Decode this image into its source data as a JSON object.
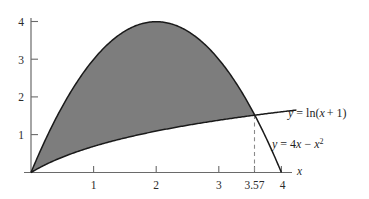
{
  "figure": {
    "title": "",
    "background_color": "#ffffff",
    "axis_color": "#555555",
    "curve_color": "#1a1a1a",
    "shade_color": "#7d7d7d",
    "dash_color": "#8a8a8a"
  },
  "axes": {
    "x_axis_name": "x",
    "y_axis_name": "",
    "x_ticks": [
      {
        "value": 1,
        "label": "1"
      },
      {
        "value": 2,
        "label": "2"
      },
      {
        "value": 3,
        "label": "3"
      },
      {
        "value": 3.57,
        "label": "3.57"
      },
      {
        "value": 4,
        "label": "4"
      }
    ],
    "y_ticks": [
      {
        "value": 1,
        "label": "1"
      },
      {
        "value": 2,
        "label": "2"
      },
      {
        "value": 3,
        "label": "3"
      },
      {
        "value": 4,
        "label": "4"
      }
    ]
  },
  "curve_labels": {
    "log_curve": {
      "y": "y",
      "eq": "= ln(",
      "var": "x",
      "tail": "+ 1)"
    },
    "parabola": {
      "y": "y",
      "eq": "= 4",
      "var1": "x",
      "minus": "−",
      "var2": "x",
      "exp": "2"
    }
  },
  "annotations": {
    "intersection_x": "3.57",
    "dashed_guide": "vertical dashed line at x = 3.57"
  },
  "chart_data": {
    "type": "area",
    "title": "",
    "xlabel": "x",
    "ylabel": "",
    "xlim": [
      0,
      4.25
    ],
    "ylim": [
      0,
      4.35
    ],
    "grid": false,
    "legend": "inline-curve-labels",
    "x_ticks": [
      1,
      2,
      3,
      3.57,
      4
    ],
    "y_ticks": [
      1,
      2,
      3,
      4
    ],
    "series": [
      {
        "name": "y = 4x - x^2",
        "type": "line",
        "expression": "4*x - x**2",
        "x": [
          0,
          0.25,
          0.5,
          0.75,
          1,
          1.25,
          1.5,
          1.75,
          2,
          2.25,
          2.5,
          2.75,
          3,
          3.25,
          3.5,
          3.57,
          3.75,
          4
        ],
        "values": [
          0,
          0.9375,
          1.75,
          2.4375,
          3,
          3.4375,
          3.75,
          3.9375,
          4,
          3.9375,
          3.75,
          3.4375,
          3,
          2.4375,
          1.75,
          1.5335,
          0.9375,
          0
        ]
      },
      {
        "name": "y = ln(x + 1)",
        "type": "line",
        "expression": "log(x + 1)",
        "x": [
          0,
          0.25,
          0.5,
          0.75,
          1,
          1.25,
          1.5,
          1.75,
          2,
          2.25,
          2.5,
          2.75,
          3,
          3.25,
          3.5,
          3.57,
          3.75,
          4,
          4.25
        ],
        "values": [
          0,
          0.2231,
          0.4055,
          0.5596,
          0.6931,
          0.8109,
          0.9163,
          1.0116,
          1.0986,
          1.1787,
          1.2528,
          1.3218,
          1.3863,
          1.4469,
          1.5041,
          1.5195,
          1.5581,
          1.6094,
          1.6582
        ]
      }
    ],
    "shaded_region": {
      "between": [
        "y = 4x - x^2",
        "y = ln(x + 1)"
      ],
      "x_from": 0,
      "x_to": 3.57,
      "fill": "#7d7d7d"
    },
    "annotations": [
      {
        "type": "vline",
        "x": 3.57,
        "style": "dashed",
        "label": "3.57"
      }
    ]
  }
}
